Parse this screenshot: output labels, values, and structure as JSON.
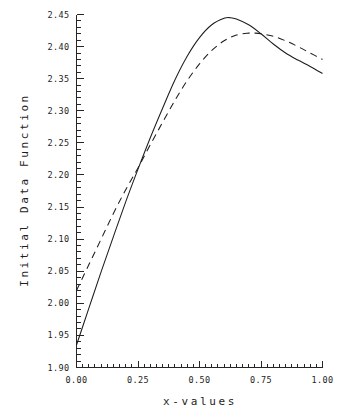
{
  "chart_data": {
    "type": "line",
    "title": "",
    "xlabel": "x-values",
    "ylabel": "Initial Data Function",
    "xlim": [
      0.0,
      1.0
    ],
    "ylim": [
      1.9,
      2.45
    ],
    "grid": false,
    "legend": "none",
    "x_ticks": [
      "0.00",
      "0.25",
      "0.50",
      "0.75",
      "1.00"
    ],
    "x_tick_values": [
      0.0,
      0.25,
      0.5,
      0.75,
      1.0
    ],
    "x_minor_step": 0.025,
    "y_ticks": [
      "1.90",
      "1.95",
      "2.00",
      "2.05",
      "2.10",
      "2.15",
      "2.20",
      "2.25",
      "2.30",
      "2.35",
      "2.40",
      "2.45"
    ],
    "y_tick_values": [
      1.9,
      1.95,
      2.0,
      2.05,
      2.1,
      2.15,
      2.2,
      2.25,
      2.3,
      2.35,
      2.4,
      2.45
    ],
    "y_minor_step": 0.01,
    "axes_style": "left-and-bottom-spines-with-inward-ticks",
    "series": [
      {
        "name": "solid-curve",
        "style": "solid",
        "color": "#1d1d1d",
        "x": [
          0.0,
          0.05,
          0.1,
          0.15,
          0.2,
          0.25,
          0.3,
          0.35,
          0.4,
          0.45,
          0.5,
          0.55,
          0.6,
          0.625,
          0.65,
          0.7,
          0.75,
          0.8,
          0.85,
          0.9,
          0.95,
          1.0
        ],
        "values": [
          1.935,
          1.992,
          2.049,
          2.104,
          2.158,
          2.209,
          2.258,
          2.304,
          2.348,
          2.385,
          2.414,
          2.434,
          2.444,
          2.445,
          2.443,
          2.434,
          2.42,
          2.404,
          2.39,
          2.379,
          2.369,
          2.358
        ]
      },
      {
        "name": "dashed-curve",
        "style": "dashed",
        "color": "#1d1d1d",
        "x": [
          0.0,
          0.05,
          0.1,
          0.15,
          0.2,
          0.25,
          0.3,
          0.35,
          0.4,
          0.45,
          0.5,
          0.55,
          0.6,
          0.65,
          0.7,
          0.725,
          0.75,
          0.8,
          0.85,
          0.9,
          0.95,
          1.0
        ],
        "values": [
          2.02,
          2.06,
          2.1,
          2.14,
          2.177,
          2.211,
          2.247,
          2.282,
          2.316,
          2.347,
          2.373,
          2.394,
          2.409,
          2.418,
          2.421,
          2.421,
          2.42,
          2.416,
          2.409,
          2.4,
          2.39,
          2.38
        ]
      }
    ]
  }
}
